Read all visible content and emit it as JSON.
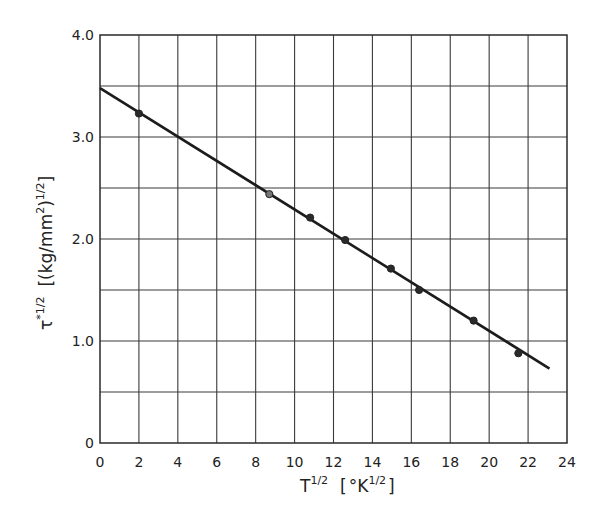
{
  "chart_data": {
    "type": "scatter",
    "title": "",
    "xlabel": "T^1/2 [°K^1/2]",
    "ylabel": "τ*^1/2 [(kg/mm²)^1/2]",
    "xlim": [
      0,
      24
    ],
    "ylim": [
      0,
      4.0
    ],
    "grid": true,
    "x_ticks": [
      "0",
      "2",
      "4",
      "6",
      "8",
      "10",
      "12",
      "14",
      "16",
      "18",
      "20",
      "22",
      "24"
    ],
    "y_ticks": [
      "0",
      "1.0",
      "2.0",
      "3.0",
      "4.0"
    ],
    "y_grid_step": 0.5,
    "x_grid_step": 2,
    "series": [
      {
        "name": "measured",
        "points": [
          {
            "x": 2.0,
            "y": 3.23
          },
          {
            "x": 8.7,
            "y": 2.44
          },
          {
            "x": 10.8,
            "y": 2.21
          },
          {
            "x": 12.6,
            "y": 1.99
          },
          {
            "x": 14.95,
            "y": 1.71
          },
          {
            "x": 16.4,
            "y": 1.5
          },
          {
            "x": 19.2,
            "y": 1.2
          },
          {
            "x": 21.5,
            "y": 0.88
          }
        ]
      },
      {
        "name": "linear fit",
        "line": [
          {
            "x": 0,
            "y": 3.48
          },
          {
            "x": 23.1,
            "y": 0.73
          }
        ]
      }
    ]
  },
  "labels": {
    "x_main": "T",
    "x_exp": "1/2",
    "x_unit_open": "[",
    "x_unit_deg": "°K",
    "x_unit_exp": "1/2",
    "x_unit_close": "]",
    "y_main": "τ",
    "y_star": "*",
    "y_exp": "1/2",
    "y_unit": "[(kg/mm",
    "y_unit_sq": "2",
    "y_unit_close_paren": ")",
    "y_unit_exp": "1/2",
    "y_unit_close": "]"
  }
}
